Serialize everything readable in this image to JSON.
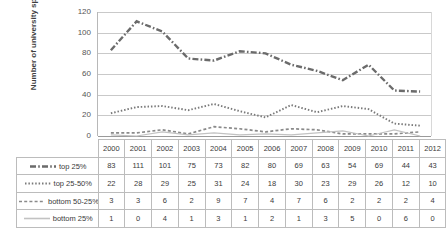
{
  "chart_data": {
    "type": "line",
    "title": "",
    "xlabel": "",
    "ylabel": "Number of university spin-outs",
    "ylim": [
      0,
      120
    ],
    "yticks": [
      0,
      20,
      40,
      60,
      80,
      100,
      120
    ],
    "grid": true,
    "legend_position": "table-left",
    "categories": [
      "2000",
      "2001",
      "2002",
      "2003",
      "2004",
      "2005",
      "2006",
      "2007",
      "2008",
      "2009",
      "2010",
      "2011",
      "2012"
    ],
    "series": [
      {
        "name": "top 25%",
        "style": "dash-dot",
        "color": "#6b6b6b",
        "values": [
          83,
          111,
          101,
          75,
          73,
          82,
          80,
          69,
          63,
          54,
          69,
          44,
          43
        ]
      },
      {
        "name": "top 25-50%",
        "style": "dotted",
        "color": "#7a7a7a",
        "values": [
          22,
          28,
          29,
          25,
          31,
          24,
          18,
          30,
          23,
          29,
          26,
          12,
          10
        ]
      },
      {
        "name": "bottom 50-25%",
        "style": "dashed",
        "color": "#8a8a8a",
        "values": [
          3,
          3,
          6,
          2,
          9,
          7,
          4,
          7,
          6,
          2,
          2,
          2,
          4
        ]
      },
      {
        "name": "bottom 25%",
        "style": "solid",
        "color": "#c2c2c2",
        "values": [
          1,
          0,
          4,
          1,
          3,
          1,
          2,
          1,
          3,
          5,
          0,
          6,
          0
        ]
      }
    ]
  },
  "axis": {
    "y_title": "Number of university spin-outs",
    "y_tick_labels": [
      "120",
      "100",
      "80",
      "60",
      "40",
      "20",
      "0"
    ]
  }
}
